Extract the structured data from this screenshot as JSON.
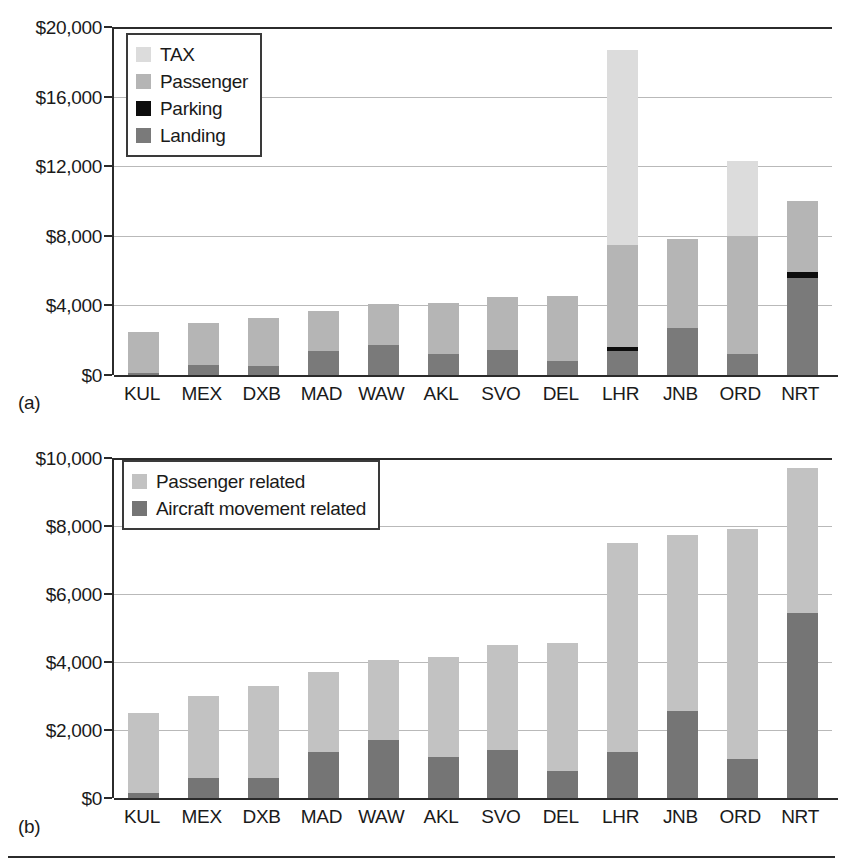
{
  "figure": {
    "background": "#ffffff",
    "axis_color": "#2b2b2b",
    "grid_color": "#b9b9b9"
  },
  "colors": {
    "tax": "#dcdcdc",
    "passenger": "#b5b5b5",
    "parking": "#0d0d0d",
    "landing": "#7a7a7a",
    "passenger_related": "#c2c2c2",
    "aircraft_movement_related": "#757575"
  },
  "panel_a": {
    "tag": "(a)",
    "legend": [
      {
        "label": "TAX",
        "color": "#dcdcdc",
        "key": "tax"
      },
      {
        "label": "Passenger",
        "color": "#b5b5b5",
        "key": "passenger"
      },
      {
        "label": "Parking",
        "color": "#0d0d0d",
        "key": "parking"
      },
      {
        "label": "Landing",
        "color": "#7a7a7a",
        "key": "landing"
      }
    ],
    "chart_data": {
      "type": "bar",
      "subtype": "stacked",
      "title": "",
      "xlabel": "",
      "ylabel": "",
      "ylim": [
        0,
        20000
      ],
      "ytick_values": [
        0,
        4000,
        8000,
        12000,
        16000,
        20000
      ],
      "ytick_labels": [
        "$0",
        "$4,000",
        "$8,000",
        "$12,000",
        "$16,000",
        "$20,000"
      ],
      "grid": true,
      "legend_position": "upper-left-inside",
      "categories": [
        "KUL",
        "MEX",
        "DXB",
        "MAD",
        "WAW",
        "AKL",
        "SVO",
        "DEL",
        "LHR",
        "JNB",
        "ORD",
        "NRT"
      ],
      "series": [
        {
          "name": "Landing",
          "color": "#7a7a7a",
          "values": [
            100,
            550,
            500,
            1400,
            1700,
            1200,
            1450,
            800,
            1400,
            2700,
            1200,
            5600
          ]
        },
        {
          "name": "Parking",
          "color": "#0d0d0d",
          "values": [
            0,
            0,
            0,
            0,
            0,
            0,
            0,
            0,
            200,
            0,
            0,
            300
          ]
        },
        {
          "name": "Passenger",
          "color": "#b5b5b5",
          "values": [
            2400,
            2450,
            2800,
            2300,
            2400,
            2950,
            3050,
            3750,
            5900,
            5100,
            6800,
            4100
          ]
        },
        {
          "name": "TAX",
          "color": "#dcdcdc",
          "values": [
            0,
            0,
            0,
            0,
            0,
            0,
            0,
            0,
            11200,
            0,
            4300,
            0
          ]
        }
      ],
      "totals": [
        2500,
        3000,
        3300,
        3700,
        4100,
        4150,
        4500,
        4550,
        18700,
        7800,
        12300,
        10000
      ]
    }
  },
  "panel_b": {
    "tag": "(b)",
    "legend": [
      {
        "label": "Passenger related",
        "color": "#c2c2c2",
        "key": "passenger_related"
      },
      {
        "label": "Aircraft movement related",
        "color": "#757575",
        "key": "aircraft_movement_related"
      }
    ],
    "chart_data": {
      "type": "bar",
      "subtype": "stacked",
      "title": "",
      "xlabel": "",
      "ylabel": "",
      "ylim": [
        0,
        10000
      ],
      "ytick_values": [
        0,
        2000,
        4000,
        6000,
        8000,
        10000
      ],
      "ytick_labels": [
        "$0",
        "$2,000",
        "$4,000",
        "$6,000",
        "$8,000",
        "$10,000"
      ],
      "grid": true,
      "legend_position": "upper-left-inside",
      "categories": [
        "KUL",
        "MEX",
        "DXB",
        "MAD",
        "WAW",
        "AKL",
        "SVO",
        "DEL",
        "LHR",
        "JNB",
        "ORD",
        "NRT"
      ],
      "series": [
        {
          "name": "Aircraft movement related",
          "color": "#757575",
          "values": [
            150,
            600,
            600,
            1350,
            1700,
            1200,
            1400,
            800,
            1350,
            2550,
            1150,
            5450
          ]
        },
        {
          "name": "Passenger related",
          "color": "#c2c2c2",
          "values": [
            2350,
            2400,
            2700,
            2350,
            2350,
            2950,
            3100,
            3750,
            6150,
            5200,
            6750,
            4250
          ]
        }
      ],
      "totals": [
        2500,
        3000,
        3300,
        3700,
        4050,
        4150,
        4500,
        4550,
        7500,
        7750,
        7900,
        9700
      ]
    }
  }
}
